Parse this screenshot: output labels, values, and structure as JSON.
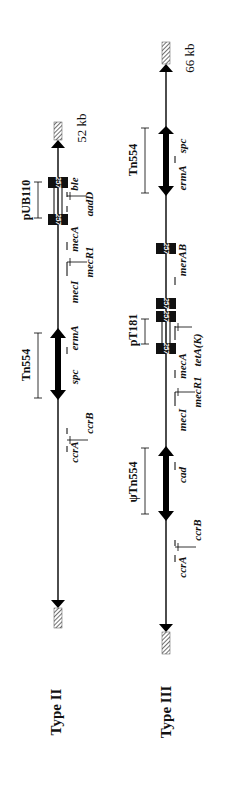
{
  "figure": {
    "orientation": "rotated-90-ccw",
    "types": [
      {
        "label": "Type II",
        "size": "52 kb",
        "transposons": [
          {
            "label": "Tn554"
          }
        ],
        "plasmids": [
          {
            "label": "pUB110"
          }
        ],
        "genes": [
          "ccrA",
          "ccrB",
          "spc",
          "ermA",
          "mecI",
          "mecR1",
          "mecA",
          "aadD",
          "ble"
        ],
        "gene_labels": {
          "ccrA": "ccrA",
          "ccrB": "ccrB",
          "spc": "spc",
          "ermA": "ermA",
          "mecI": "mecI",
          "mecR1": "mecR1",
          "mecA": "mecA",
          "aadD": "aadD",
          "ble": "ble"
        },
        "is_elements": [
          "257",
          "257"
        ]
      },
      {
        "label": "Type III",
        "size": "66 kb",
        "transposons": [
          {
            "label": "ψTn554"
          },
          {
            "label": "Tn554"
          }
        ],
        "plasmids": [
          {
            "label": "pT181"
          }
        ],
        "genes": [
          "ccrA",
          "ccrB",
          "cad",
          "mecI",
          "mecR1",
          "mecA",
          "tetA(K)",
          "merAB",
          "ermA",
          "spc"
        ],
        "gene_labels": {
          "ccrA": "ccrA",
          "ccrB": "ccrB",
          "cad": "cad",
          "mecI": "mecI",
          "mecR1": "mecR1",
          "mecA": "mecA",
          "tetAK": "tetA(K)",
          "merAB": "merAB",
          "ermA": "ermA",
          "spc": "spc"
        },
        "is_elements": [
          "257",
          "257",
          "257",
          "257"
        ]
      }
    ]
  }
}
